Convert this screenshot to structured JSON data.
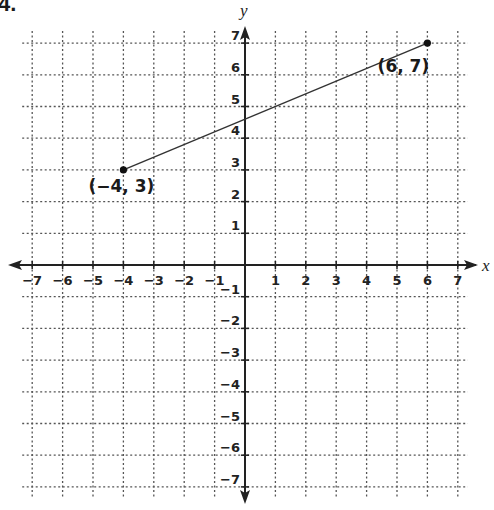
{
  "problem": {
    "number": "4."
  },
  "chart_data": {
    "type": "line",
    "title": "",
    "xlabel": "x",
    "ylabel": "y",
    "xlim": [
      -7,
      7
    ],
    "ylim": [
      -7,
      7
    ],
    "grid": true,
    "grid_style": "dotted",
    "x_ticks": [
      -7,
      -6,
      -5,
      -4,
      -3,
      -2,
      -1,
      1,
      2,
      3,
      4,
      5,
      6,
      7
    ],
    "y_ticks": [
      -7,
      -6,
      -5,
      -4,
      -3,
      -2,
      -1,
      1,
      2,
      3,
      4,
      5,
      6,
      7
    ],
    "x_tick_labels": [
      "−7",
      "−6",
      "−5",
      "−4",
      "−3",
      "−2",
      "−1",
      "1",
      "2",
      "3",
      "4",
      "5",
      "6",
      "7"
    ],
    "y_tick_labels": [
      "−7",
      "−6",
      "−5",
      "−4",
      "−3",
      "−2",
      "−1",
      "1",
      "2",
      "3",
      "4",
      "5",
      "6",
      "7"
    ],
    "series": [
      {
        "name": "segment",
        "points": [
          {
            "x": -4,
            "y": 3,
            "label": "(−4, 3)"
          },
          {
            "x": 6,
            "y": 7,
            "label": "(6, 7)"
          }
        ]
      }
    ],
    "colors": {
      "axis": "#222222",
      "grid": "#555555",
      "line": "#333333",
      "point": "#111111"
    }
  }
}
